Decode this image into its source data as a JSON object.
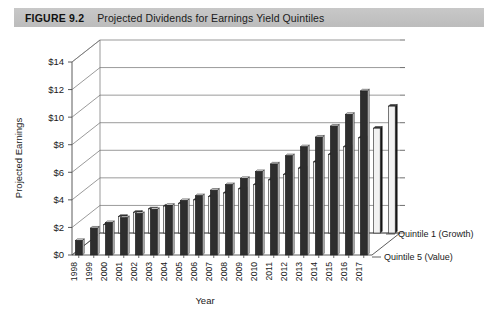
{
  "figure": {
    "number": "FIGURE 9.2",
    "title": "Projected Dividends for Earnings Yield Quintiles"
  },
  "chart_data": {
    "type": "bar",
    "title": "Projected Dividends for Earnings Yield Quintiles",
    "xlabel": "Year",
    "ylabel": "Projected Earnings",
    "ylim": [
      0,
      14
    ],
    "ytick_labels": [
      "$0",
      "$2",
      "$4",
      "$6",
      "$8",
      "$10",
      "$12",
      "$14"
    ],
    "ytick_values": [
      0,
      2,
      4,
      6,
      8,
      10,
      12,
      14
    ],
    "grid": true,
    "legend_position": "right",
    "projection": "3d",
    "categories": [
      "1998",
      "1999",
      "2000",
      "2001",
      "2002",
      "2003",
      "2004",
      "2005",
      "2006",
      "2007",
      "2008",
      "2009",
      "2010",
      "2011",
      "2012",
      "2013",
      "2014",
      "2015",
      "2016",
      "2017"
    ],
    "series": [
      {
        "name": "Quintile 5 (Value)",
        "color": "#2e2e2e",
        "values": [
          1.05,
          1.95,
          2.35,
          2.7,
          3.0,
          3.3,
          3.6,
          3.95,
          4.3,
          4.7,
          5.1,
          5.55,
          6.05,
          6.6,
          7.2,
          7.85,
          8.55,
          9.35,
          10.2,
          11.9
        ]
      },
      {
        "name": "Quintile 1 (Growth)",
        "color": "#f2f2f2",
        "values": [
          0.6,
          1.2,
          1.5,
          1.75,
          1.95,
          2.15,
          2.4,
          2.65,
          2.9,
          3.2,
          3.5,
          3.85,
          4.25,
          4.7,
          5.15,
          5.7,
          6.25,
          6.9,
          7.6,
          9.2
        ]
      }
    ],
    "legend": [
      "Quintile 5 (Value)",
      "Quintile 1 (Growth)"
    ]
  }
}
